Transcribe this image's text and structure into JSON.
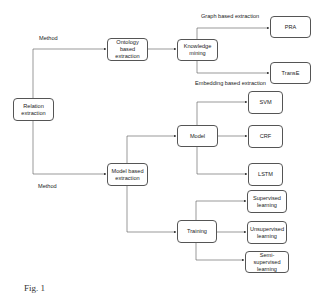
{
  "diagram": {
    "type": "flowchart",
    "nodes": {
      "relation_extraction": "Relation extraction",
      "ontology_based_extraction": "Ontology based extraction",
      "knowledge_mining": "Knowledge mining",
      "pra": "PRA",
      "transe": "TransE",
      "model_based_extraction": "Model based extraction",
      "model": "Model",
      "svm": "SVM",
      "crf": "CRF",
      "lstm": "LSTM",
      "training": "Training",
      "supervised_learning": "Supervised learning",
      "unsupervised_learning": "Unsupervised learning",
      "semi_supervised_learning": "Semi-supervised learning"
    },
    "edge_labels": {
      "method_top": "Method",
      "method_bottom": "Method",
      "graph_based": "Graph based extraction",
      "embedding_based": "Embedding based extraction"
    },
    "edges": [
      {
        "from": "Relation extraction",
        "to": "Ontology based extraction",
        "label": "Method"
      },
      {
        "from": "Relation extraction",
        "to": "Model based extraction",
        "label": "Method"
      },
      {
        "from": "Ontology based extraction",
        "to": "Knowledge mining"
      },
      {
        "from": "Knowledge mining",
        "to": "PRA",
        "label": "Graph based extraction"
      },
      {
        "from": "Knowledge mining",
        "to": "TransE",
        "label": "Embedding based extraction"
      },
      {
        "from": "Model based extraction",
        "to": "Model"
      },
      {
        "from": "Model based extraction",
        "to": "Training"
      },
      {
        "from": "Model",
        "to": "SVM"
      },
      {
        "from": "Model",
        "to": "CRF"
      },
      {
        "from": "Model",
        "to": "LSTM"
      },
      {
        "from": "Training",
        "to": "Supervised learning"
      },
      {
        "from": "Training",
        "to": "Unsupervised learning"
      },
      {
        "from": "Training",
        "to": "Semi-supervised learning"
      }
    ],
    "caption": "Fig. 1"
  },
  "colors": {
    "line": "#555555",
    "node_border": "#555555",
    "background": "#ffffff"
  }
}
